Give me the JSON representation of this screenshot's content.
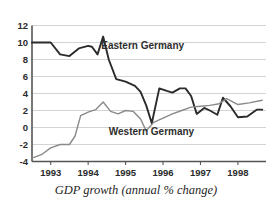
{
  "chart_data": {
    "type": "line",
    "title": "",
    "caption": "GDP growth (annual % change)",
    "xlabel": "",
    "ylabel": "",
    "xlim": [
      1992.5,
      1998.75
    ],
    "ylim": [
      -4,
      12
    ],
    "ytick_step": 2,
    "yticks": [
      12,
      10,
      8,
      6,
      4,
      2,
      0,
      -2,
      -4
    ],
    "ytick_labels": [
      "12",
      "10",
      "8",
      "6",
      "4",
      "2",
      "0",
      "-2",
      "-4"
    ],
    "xticks": [
      1993,
      1994,
      1995,
      1996,
      1997,
      1998
    ],
    "xtick_labels": [
      "1993",
      "1994",
      "1995",
      "1996",
      "1997",
      "1998"
    ],
    "grid": "horizontal",
    "legend_position": "inline-annotations",
    "series": [
      {
        "name": "Eastern Germany",
        "color": "#2b2b2b",
        "label_x": 1994.35,
        "label_y": 9.6,
        "x": [
          1992.5,
          1992.75,
          1993.0,
          1993.25,
          1993.5,
          1993.75,
          1994.0,
          1994.1,
          1994.25,
          1994.4,
          1994.55,
          1994.75,
          1995.0,
          1995.25,
          1995.4,
          1995.55,
          1995.7,
          1995.9,
          1996.1,
          1996.25,
          1996.45,
          1996.6,
          1996.75,
          1996.9,
          1997.1,
          1997.25,
          1997.45,
          1997.6,
          1997.8,
          1998.0,
          1998.25,
          1998.5,
          1998.65
        ],
        "y": [
          10.0,
          10.0,
          10.0,
          8.6,
          8.4,
          9.3,
          9.6,
          9.5,
          8.6,
          10.7,
          8.0,
          5.7,
          5.4,
          4.9,
          4.2,
          2.6,
          0.5,
          4.6,
          4.3,
          4.1,
          4.6,
          4.6,
          3.7,
          1.6,
          2.3,
          2.0,
          1.5,
          3.5,
          2.5,
          1.2,
          1.3,
          2.1,
          2.1
        ]
      },
      {
        "name": "Western Germany",
        "color": "#8a8a8a",
        "label_x": 1994.55,
        "label_y": -0.55,
        "x": [
          1992.5,
          1992.75,
          1993.0,
          1993.25,
          1993.5,
          1993.65,
          1993.8,
          1994.0,
          1994.2,
          1994.4,
          1994.6,
          1994.8,
          1995.0,
          1995.2,
          1995.4,
          1995.55,
          1995.75,
          1996.0,
          1996.25,
          1996.5,
          1996.75,
          1997.0,
          1997.25,
          1997.5,
          1997.7,
          1998.0,
          1998.3,
          1998.65
        ],
        "y": [
          -3.6,
          -3.2,
          -2.4,
          -2.0,
          -2.0,
          -1.0,
          1.4,
          1.8,
          2.1,
          3.0,
          1.9,
          1.6,
          2.0,
          1.9,
          1.0,
          -0.4,
          0.6,
          1.1,
          1.6,
          2.0,
          2.4,
          2.5,
          2.6,
          2.8,
          3.4,
          2.7,
          2.9,
          3.2
        ]
      }
    ]
  },
  "axis": {
    "y_axis_name": "y-axis",
    "x_axis_name": "x-axis"
  }
}
